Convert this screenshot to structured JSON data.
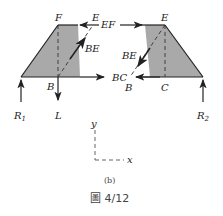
{
  "figure": {
    "subfigure_label": "(b)",
    "caption": "圖 4/12",
    "colors": {
      "shade": "#a9a9a9",
      "line": "#222222",
      "dash": "#555555"
    }
  },
  "left_body": {
    "points": {
      "F": "F",
      "E": "E",
      "B": "B"
    },
    "forces": {
      "EF": "EF",
      "BE": "BE",
      "BC": "BC",
      "L": "L",
      "R1": "R",
      "R1_sub": "1"
    }
  },
  "right_body": {
    "points": {
      "E": "E",
      "B": "B",
      "C": "C"
    },
    "forces": {
      "BE": "BE",
      "R2": "R",
      "R2_sub": "2"
    }
  },
  "axes": {
    "x": "x",
    "y": "y"
  }
}
